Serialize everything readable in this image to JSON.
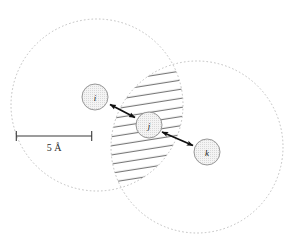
{
  "figure": {
    "title": "",
    "background_color": "#ffffff",
    "scale_bar": {
      "label": "5 Å",
      "x_start": 16,
      "x_end": 92,
      "y": 136,
      "tick_height": 10,
      "color": "#3a3a3a"
    },
    "cutoff_spheres": [
      {
        "name": "cutoff-sphere-i",
        "cx": 97,
        "cy": 105,
        "r": 86,
        "stroke_color": "#b8b8b8",
        "dash": "1.6 2.2"
      },
      {
        "name": "cutoff-sphere-k",
        "cx": 197,
        "cy": 147,
        "r": 86,
        "stroke_color": "#b8b8b8",
        "dash": "1.6 2.2"
      }
    ],
    "overlap_region": {
      "name": "overlap-lens",
      "hatch_color": "#4a4a4a",
      "hatch_angle_deg": -9,
      "hatch_spacing": 9
    },
    "atoms": [
      {
        "id": "i",
        "label": "i",
        "cx": 95,
        "cy": 97,
        "r": 13,
        "fill": "#f2f2f2",
        "stroke": "#8c8c8c"
      },
      {
        "id": "j",
        "label": "j",
        "cx": 149,
        "cy": 125,
        "r": 13,
        "fill": "#f2f2f2",
        "stroke": "#8c8c8c"
      },
      {
        "id": "k",
        "label": "k",
        "cx": 207,
        "cy": 152,
        "r": 13,
        "fill": "#f2f2f2",
        "stroke": "#8c8c8c"
      }
    ],
    "distance_arrows": [
      {
        "id": "arrow-i-j",
        "from": "i",
        "to": "j",
        "x1": 109,
        "y1": 104,
        "x2": 136,
        "y2": 118,
        "color": "#101010"
      },
      {
        "id": "arrow-j-k",
        "from": "j",
        "to": "k",
        "x1": 161,
        "y1": 132,
        "x2": 194,
        "y2": 146,
        "color": "#101010"
      }
    ]
  }
}
